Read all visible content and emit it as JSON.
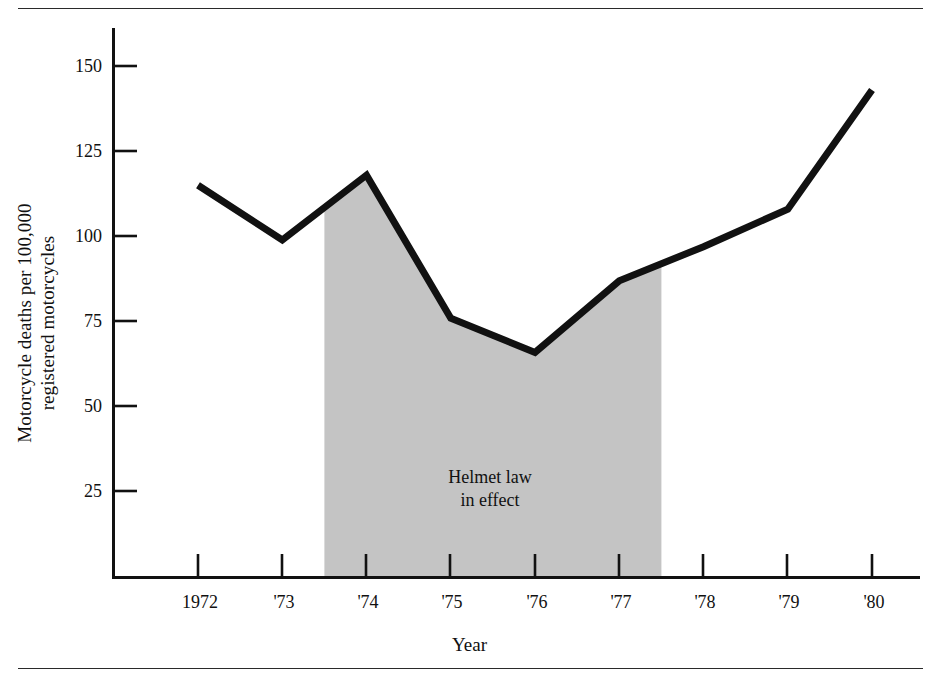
{
  "chart_data": {
    "type": "line",
    "title": "",
    "subtitle": "",
    "xlabel": "Year",
    "ylabel": "Motorcycle deaths per 100,000\nregistered motorcycles",
    "categories": [
      "1972",
      "'73",
      "'74",
      "'75",
      "'76",
      "'77",
      "'78",
      "'79",
      "'80"
    ],
    "x_values": [
      1972,
      1973,
      1974,
      1975,
      1976,
      1977,
      1978,
      1979,
      1980
    ],
    "values": [
      115,
      99,
      118,
      76,
      66,
      87,
      97,
      108,
      143
    ],
    "series": [
      {
        "name": "Motorcycle deaths per 100,000 registered motorcycles",
        "values": [
          115,
          99,
          118,
          76,
          66,
          87,
          97,
          108,
          143
        ]
      }
    ],
    "xlim": [
      1971.7,
      1980.3
    ],
    "ylim": [
      0,
      160
    ],
    "y_ticks": [
      25,
      50,
      75,
      100,
      125,
      150
    ],
    "y_tick_labels": [
      "25",
      "50",
      "75",
      "100",
      "125",
      "150"
    ],
    "x_tick_labels": [
      "1972",
      "'73",
      "'74",
      "'75",
      "'76",
      "'77",
      "'78",
      "'79",
      "'80"
    ],
    "grid": false,
    "legend": false,
    "legend_position": "none",
    "annotations": [
      {
        "text": "Helmet law\nin effect",
        "x": 1975.5,
        "y": 38,
        "shaded_region": {
          "x_start": 1973.5,
          "x_end": 1977.5,
          "label": "Helmet law in effect",
          "color": "#c4c4c4"
        }
      }
    ],
    "colors": {
      "line": "#111111",
      "shaded_band": "#c4c4c4",
      "axis": "#1a1a1a",
      "background": "#ffffff"
    }
  },
  "figure": {
    "ylabel_line1": "Motorcycle deaths per 100,000",
    "ylabel_line2": "registered motorcycles",
    "ylabel_full": "Motorcycle deaths per 100,000\nregistered motorcycles",
    "xlabel": "Year",
    "annotation_line1": "Helmet law",
    "annotation_line2": "in effect",
    "annotation_full": "Helmet law\nin effect",
    "y_tick_labels": [
      "150",
      "125",
      "100",
      "75",
      "50",
      "25"
    ],
    "x_tick_labels": [
      "1972",
      "'73",
      "'74",
      "'75",
      "'76",
      "'77",
      "'78",
      "'79",
      "'80"
    ]
  }
}
